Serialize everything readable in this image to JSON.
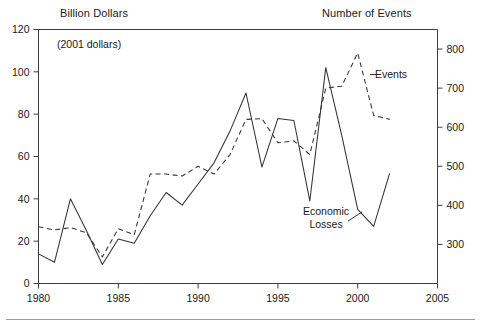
{
  "figure": {
    "left_axis_title": "Billion Dollars",
    "right_axis_title": "Number of Events",
    "units_note": "(2001 dollars)",
    "label_events": "Events",
    "label_losses_line1": "Economic",
    "label_losses_line2": "Losses"
  },
  "chart_data": {
    "type": "line",
    "title": "",
    "subtitle": "(2001 dollars)",
    "xlabel": "",
    "ylabel": "Billion Dollars",
    "y2label": "Number of Events",
    "xlim": [
      1980,
      2005
    ],
    "ylim": [
      0,
      120
    ],
    "y2lim": [
      200,
      850
    ],
    "xticks": [
      1980,
      1985,
      1990,
      1995,
      2000,
      2005
    ],
    "yticks": [
      0,
      20,
      40,
      60,
      80,
      100,
      120
    ],
    "y2ticks": [
      300,
      400,
      500,
      600,
      700,
      800
    ],
    "grid": false,
    "legend": "inline-annotations",
    "x": [
      1980,
      1981,
      1982,
      1983,
      1984,
      1985,
      1986,
      1987,
      1988,
      1989,
      1990,
      1991,
      1992,
      1993,
      1994,
      1995,
      1996,
      1997,
      1998,
      1999,
      2000,
      2001,
      2002
    ],
    "series": [
      {
        "name": "Economic Losses",
        "axis": "left",
        "units": "Billion Dollars (2001 dollars)",
        "style": "solid",
        "color": "#333333",
        "values": [
          14,
          10,
          40,
          25,
          9,
          21,
          19,
          32,
          43,
          37,
          47,
          57,
          72,
          90,
          55,
          78,
          77,
          39,
          102,
          70,
          35,
          27,
          52
        ]
      },
      {
        "name": "Events",
        "axis": "right",
        "units": "Number of Events",
        "style": "dashed",
        "color": "#333333",
        "values": [
          345,
          337,
          343,
          330,
          268,
          340,
          325,
          480,
          480,
          475,
          500,
          480,
          530,
          620,
          622,
          560,
          565,
          530,
          700,
          705,
          790,
          630,
          620
        ]
      }
    ]
  }
}
